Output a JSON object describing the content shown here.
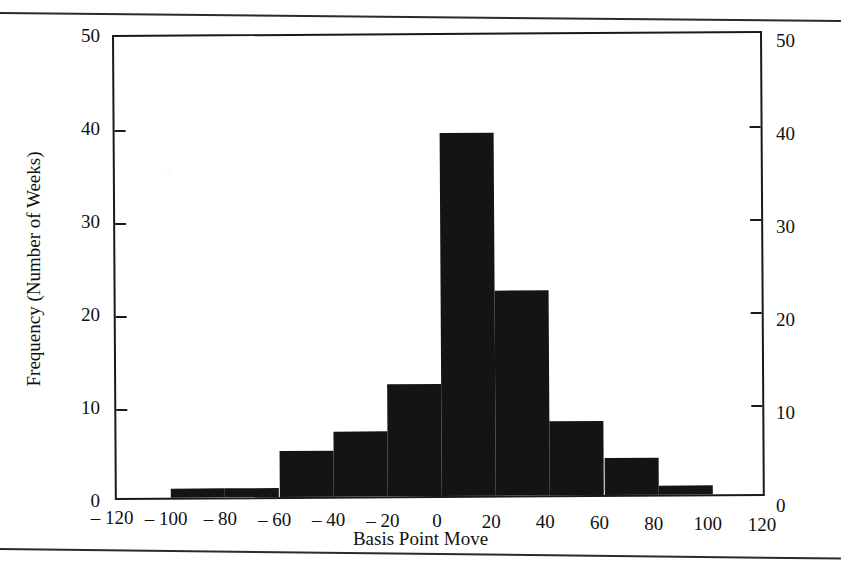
{
  "chart_data": {
    "type": "bar",
    "title": "",
    "subtitle": "",
    "xlabel": "Basis Point Move",
    "ylabel": "Frequency (Number of Weeks)",
    "grid": false,
    "legend": "none",
    "xlim": [
      -120,
      120
    ],
    "ylim": [
      0,
      50
    ],
    "bin_width": 20,
    "x_tick_labels": [
      "– 120",
      "– 100",
      "– 80",
      "– 60",
      "– 40",
      "– 20",
      "0",
      "20",
      "40",
      "60",
      "80",
      "100",
      "120"
    ],
    "x_tick_values": [
      -120,
      -100,
      -80,
      -60,
      -40,
      -20,
      0,
      20,
      40,
      60,
      80,
      100,
      120
    ],
    "y_tick_labels_left": [
      "50",
      "40",
      "30",
      "20",
      "10",
      "0"
    ],
    "y_tick_labels_right": [
      "50",
      "40",
      "30",
      "20",
      "10",
      "0"
    ],
    "y_tick_values": [
      50,
      40,
      30,
      20,
      10,
      0
    ],
    "bins": [
      {
        "range": "-120 to -100",
        "start": -120,
        "end": -100,
        "value": 0
      },
      {
        "range": "-100 to -80",
        "start": -100,
        "end": -80,
        "value": 1
      },
      {
        "range": "-80 to -60",
        "start": -80,
        "end": -60,
        "value": 1
      },
      {
        "range": "-60 to -40",
        "start": -60,
        "end": -40,
        "value": 5
      },
      {
        "range": "-40 to -20",
        "start": -40,
        "end": -20,
        "value": 7
      },
      {
        "range": "-20 to 0",
        "start": -20,
        "end": 0,
        "value": 12
      },
      {
        "range": "0 to 20",
        "start": 0,
        "end": 20,
        "value": 39
      },
      {
        "range": "20 to 40",
        "start": 20,
        "end": 40,
        "value": 22
      },
      {
        "range": "40 to 60",
        "start": 40,
        "end": 60,
        "value": 8
      },
      {
        "range": "60 to 80",
        "start": 60,
        "end": 80,
        "value": 4
      },
      {
        "range": "80 to 100",
        "start": 80,
        "end": 100,
        "value": 1
      },
      {
        "range": "100 to 120",
        "start": 100,
        "end": 120,
        "value": 0
      }
    ],
    "categories": [
      "-120 to -100",
      "-100 to -80",
      "-80 to -60",
      "-60 to -40",
      "-40 to -20",
      "-20 to 0",
      "0 to 20",
      "20 to 40",
      "40 to 60",
      "60 to 80",
      "80 to 100",
      "100 to 120"
    ],
    "values": [
      0,
      1,
      1,
      5,
      7,
      12,
      39,
      22,
      8,
      4,
      1,
      0
    ],
    "colors": {
      "bar_fill": "#141414",
      "axis": "#1a1a1a",
      "background": "#ffffff"
    }
  }
}
